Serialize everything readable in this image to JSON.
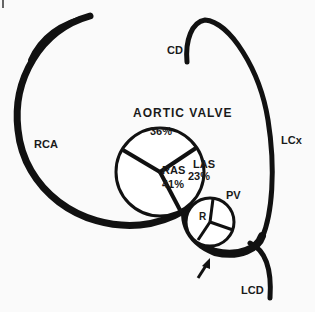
{
  "diagram": {
    "title": "AORTIC VALVE",
    "vessels": [
      {
        "id": "rca",
        "label": "RCA"
      },
      {
        "id": "cd",
        "label": "CD"
      },
      {
        "id": "lcx",
        "label": "LCx"
      },
      {
        "id": "lcd",
        "label": "LCD"
      }
    ],
    "aortic_valve": {
      "cusps": [
        {
          "id": "top",
          "label": "",
          "value": "36%"
        },
        {
          "id": "ras",
          "label": "RAS",
          "value": "41%"
        },
        {
          "id": "las",
          "label": "LAS",
          "value": "23%"
        }
      ]
    },
    "pulmonary_valve": {
      "label": "PV",
      "cusp_label": "R"
    },
    "colors": {
      "ink": "#111111",
      "background": "#ffffff"
    }
  }
}
